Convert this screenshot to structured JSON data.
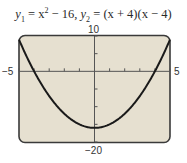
{
  "chart_data": {
    "type": "line",
    "title_parts": {
      "y1_label": "y",
      "y1_sub": "1",
      "y1_expr_a": " = x",
      "y1_sup": "2",
      "y1_expr_b": " − 16,  ",
      "y2_label": "y",
      "y2_sub": "2",
      "y2_expr": " = (x + 4)(x − 4)"
    },
    "xlabel": "",
    "ylabel": "",
    "xlim": [
      -5,
      5
    ],
    "ylim": [
      -20,
      10
    ],
    "x_scale": 1,
    "y_scale": 5,
    "tick_labels": {
      "xmin": "−5",
      "xmax": "5",
      "ymax": "10",
      "ymin": "−20"
    },
    "grid": false,
    "legend": null,
    "series": [
      {
        "name": "y1 = x^2 − 16 (identical to y2)",
        "x": [
          -5,
          -4,
          -3,
          -2,
          -1,
          0,
          1,
          2,
          3,
          4,
          5
        ],
        "values": [
          9,
          0,
          -7,
          -12,
          -15,
          -16,
          -15,
          -12,
          -7,
          0,
          9
        ]
      }
    ],
    "annotations": [
      "x-intercepts at x = −4 and x = 4",
      "vertex at (0, −16)"
    ],
    "colors": {
      "screen_background": "#e6e0d0",
      "curve": "#1a1a1a",
      "frame": "#3a3a3a"
    }
  }
}
